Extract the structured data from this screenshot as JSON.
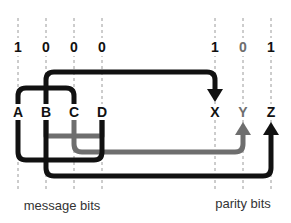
{
  "diagram": {
    "colors": {
      "black": "#111111",
      "gray": "#6e6e6e",
      "guide": "#9a9a9a"
    },
    "message_bits": {
      "caption": "message bits",
      "columns": [
        {
          "label": "A",
          "value": "1"
        },
        {
          "label": "B",
          "value": "0"
        },
        {
          "label": "C",
          "value": "0"
        },
        {
          "label": "D",
          "value": "0"
        }
      ]
    },
    "parity_bits": {
      "caption": "parity bits",
      "columns": [
        {
          "label": "X",
          "value": "1"
        },
        {
          "label": "Y",
          "value": "0"
        },
        {
          "label": "Z",
          "value": "1"
        }
      ]
    },
    "connections": [
      {
        "from": [
          "A",
          "B",
          "C"
        ],
        "to": "X",
        "color": "black"
      },
      {
        "from": [
          "B",
          "C",
          "D"
        ],
        "to": "Y",
        "color": "gray"
      },
      {
        "from": [
          "A",
          "B",
          "D"
        ],
        "to": "Z",
        "color": "black"
      }
    ]
  }
}
